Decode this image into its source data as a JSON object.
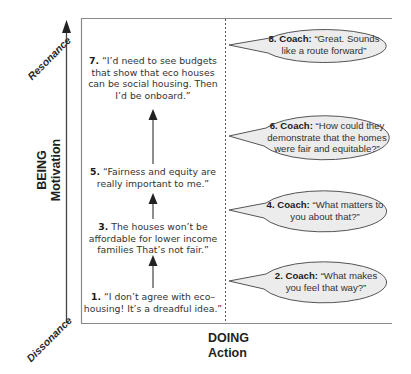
{
  "diagram": {
    "y_axis": {
      "title": "BEING",
      "subtitle": "Motivation",
      "top_label": "Resonance",
      "bottom_label": "Dissonance"
    },
    "x_axis": {
      "title": "DOING",
      "subtitle": "Action"
    },
    "left_steps": [
      {
        "num": "7.",
        "text": "“I’d need to see budgets that show that eco houses can be social housing. Then I’d be onboard.”"
      },
      {
        "num": "5.",
        "text": "“Fairness and equity are really important to me.”"
      },
      {
        "num": "3.",
        "text": "The houses won’t be affordable for lower income families That’s not fair.”"
      },
      {
        "num": "1.",
        "text": "“I don’t agree with eco– housing! It’s a dreadful idea.”"
      }
    ],
    "coach_bubbles": [
      {
        "num": "8.",
        "speaker": "Coach:",
        "text": "“Great. Sounds like a route forward”"
      },
      {
        "num": "6.",
        "speaker": "Coach:",
        "text": "“How could they demonstrate that the homes were fair and equitable?”"
      },
      {
        "num": "4.",
        "speaker": "Coach:",
        "text": "“What matters to you about that?”"
      },
      {
        "num": "2.",
        "speaker": "Coach:",
        "text": "“What makes you feel that way?”"
      }
    ],
    "colors": {
      "bubble_fill": "#ececec",
      "line": "#555555",
      "frame": "#8a8a8a",
      "text": "#2a2a2a"
    }
  }
}
